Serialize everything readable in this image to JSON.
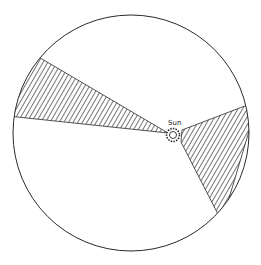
{
  "diagram": {
    "labels": {
      "sun": "Sun"
    },
    "colors": {
      "stroke": "#2a2a2a",
      "background": "#ffffff",
      "hatch": "#2a2a2a"
    },
    "orbit_circle": {
      "cx": 131,
      "cy": 133,
      "r": 118
    },
    "sun": {
      "cx": 173,
      "cy": 135,
      "r": 4
    },
    "shaded_regions": [
      {
        "name": "left-wedge",
        "points": [
          [
            168,
            133
          ],
          [
            38,
            61
          ],
          [
            17,
            110
          ]
        ]
      },
      {
        "name": "right-wedge",
        "points": [
          [
            182,
            130
          ],
          [
            248,
            106
          ],
          [
            217,
            211
          ],
          [
            181,
            142
          ]
        ]
      }
    ]
  }
}
